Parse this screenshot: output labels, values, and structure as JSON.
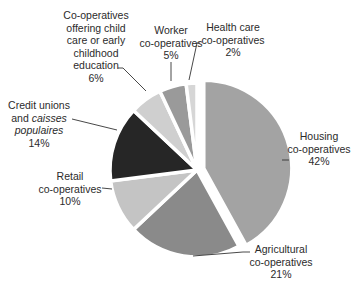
{
  "chart_data": {
    "type": "pie",
    "title": "",
    "start_angle_deg": 0,
    "direction": "clockwise",
    "slices": [
      {
        "name": "Housing co-operatives",
        "value": 42,
        "label_lines": [
          "Housing",
          "co-operatives",
          "42%"
        ],
        "color": "#a3a3a3",
        "exploded": true
      },
      {
        "name": "Agricultural co-operatives",
        "value": 21,
        "label_lines": [
          "Agricultural",
          "co-operatives",
          "21%"
        ],
        "color": "#8a8a8a",
        "exploded": false
      },
      {
        "name": "Retail co-operatives",
        "value": 10,
        "label_lines": [
          "Retail",
          "co-operatives",
          "10%"
        ],
        "color": "#c4c4c4",
        "exploded": false
      },
      {
        "name": "Credit unions and caisses populaires",
        "value": 14,
        "label_lines": [
          "Credit unions",
          "and caisses",
          "populaires",
          "14%"
        ],
        "color": "#262626",
        "exploded": false
      },
      {
        "name": "Co-operatives offering child care or early childhood education",
        "value": 6,
        "label_lines": [
          "Co-operatives",
          "offering child",
          "care or early",
          "childhood",
          "education",
          "6%"
        ],
        "color": "#cfcfcf",
        "exploded": false
      },
      {
        "name": "Worker co-operatives",
        "value": 5,
        "label_lines": [
          "Worker",
          "co-operatives",
          "5%"
        ],
        "color": "#9a9a9a",
        "exploded": false
      },
      {
        "name": "Health care co-operatives",
        "value": 2,
        "label_lines": [
          "Health care",
          "co-operatives",
          "2%"
        ],
        "color": "#d6d6d6",
        "exploded": false
      }
    ],
    "legend": "none (direct labels with leader lines)"
  },
  "labels": {
    "housing": {
      "l1": "Housing",
      "l2": "co-operatives",
      "pct": "42%"
    },
    "agricultural": {
      "l1": "Agricultural",
      "l2": "co-operatives",
      "pct": "21%"
    },
    "retail": {
      "l1": "Retail",
      "l2": "co-operatives",
      "pct": "10%"
    },
    "credit": {
      "l1": "Credit unions",
      "l2": "and ",
      "l2i": "caisses",
      "l3i": "populaires",
      "pct": "14%"
    },
    "childcare": {
      "l1": "Co-operatives",
      "l2": "offering child",
      "l3": "care or early",
      "l4": "childhood",
      "l5": "education",
      "pct": "6%"
    },
    "worker": {
      "l1": "Worker",
      "l2": "co-operatives",
      "pct": "5%"
    },
    "health": {
      "l1": "Health care",
      "l2": "co-operatives",
      "pct": "2%"
    }
  }
}
